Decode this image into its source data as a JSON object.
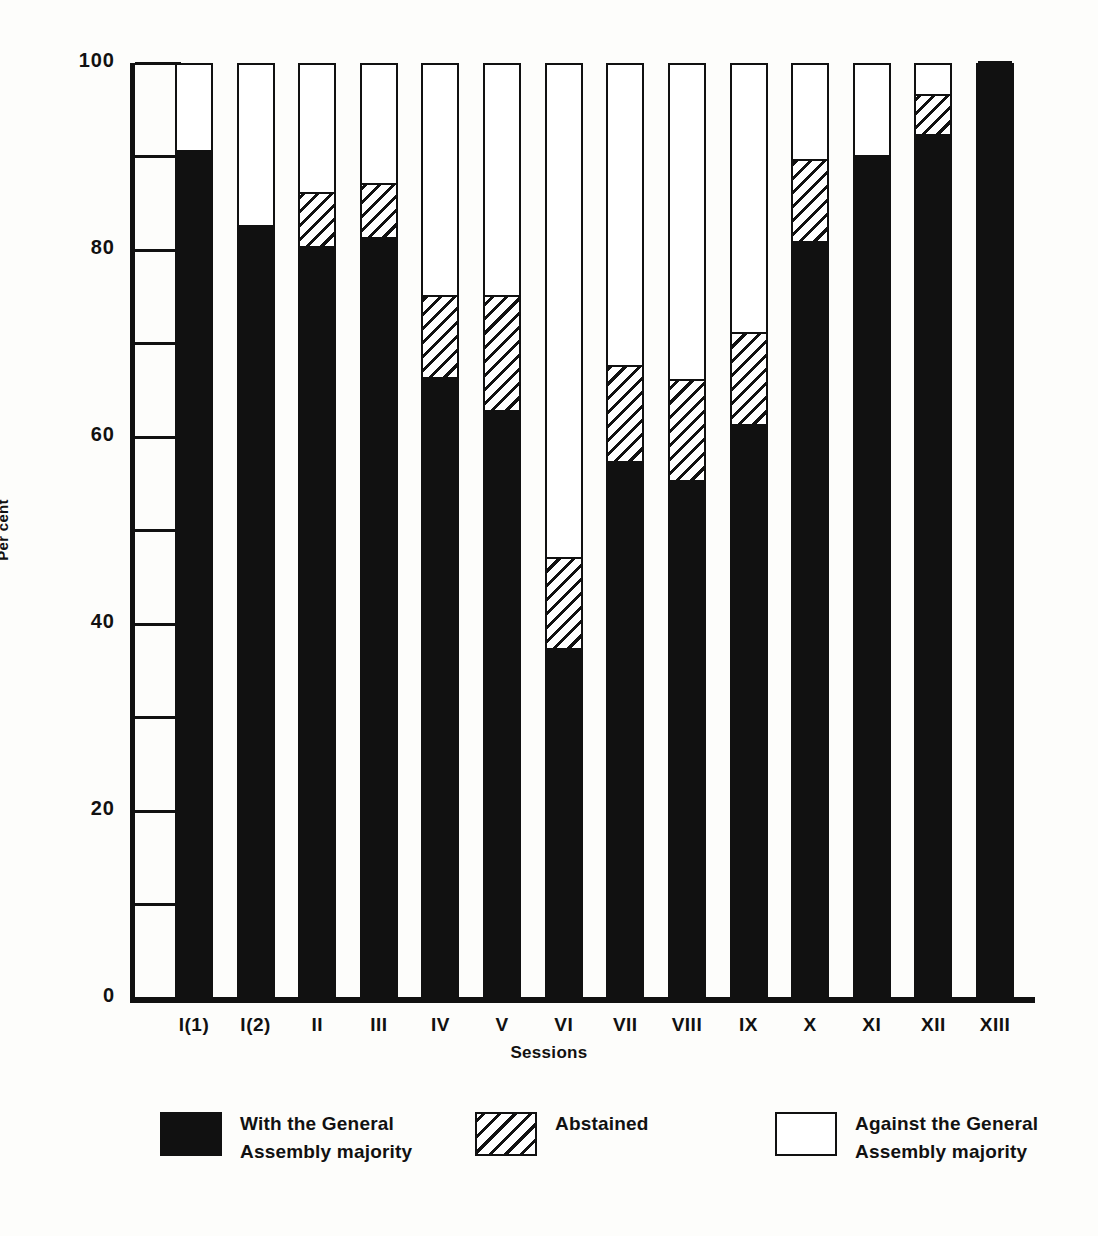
{
  "chart": {
    "type": "bar",
    "ylabel": "Per cent",
    "xlabel": "Sessions"
  },
  "chart_data": {
    "type": "bar",
    "title": "",
    "subtitle": "",
    "xlabel": "Sessions",
    "ylabel": "Per cent",
    "ylim": [
      0,
      100
    ],
    "yticks": [
      0,
      20,
      40,
      60,
      80,
      100
    ],
    "yticks_minor": [
      10,
      30,
      50,
      70,
      90
    ],
    "grid": false,
    "stacked": true,
    "legend_position": "bottom",
    "categories": [
      "I(1)",
      "I(2)",
      "II",
      "III",
      "IV",
      "V",
      "VI",
      "VII",
      "VIII",
      "IX",
      "X",
      "XI",
      "XII",
      "XIII"
    ],
    "series": [
      {
        "name": "With the General Assembly majority",
        "pattern": "solid-black",
        "values": [
          90.5,
          82.5,
          80,
          81,
          66,
          62.5,
          37,
          57,
          55,
          61,
          80.5,
          90,
          92,
          100
        ]
      },
      {
        "name": "Abstained",
        "pattern": "diagonal-hatch",
        "values": [
          0,
          0,
          6,
          6,
          9,
          12.5,
          10,
          10.5,
          11,
          10,
          9,
          0,
          4.5,
          0
        ]
      },
      {
        "name": "Against the General Assembly majority",
        "pattern": "white",
        "values": [
          9.5,
          17.5,
          14,
          13,
          25,
          25,
          53,
          32.5,
          34,
          29,
          10.5,
          10,
          3.5,
          0
        ]
      }
    ],
    "cumulative_tops": {
      "with": [
        90.5,
        82.5,
        80,
        81,
        66,
        62.5,
        37,
        57,
        55,
        61,
        80.5,
        90,
        92,
        100
      ],
      "abstained": [
        90.5,
        82.5,
        86,
        87,
        75,
        75,
        47,
        67.5,
        66,
        71,
        89.5,
        90,
        96.5,
        100
      ]
    }
  },
  "yaxis": {
    "ticks": [
      {
        "value": 100,
        "label": "100",
        "major": true
      },
      {
        "value": 90,
        "label": "",
        "major": false
      },
      {
        "value": 80,
        "label": "80",
        "major": true
      },
      {
        "value": 70,
        "label": "",
        "major": false
      },
      {
        "value": 60,
        "label": "60",
        "major": true
      },
      {
        "value": 50,
        "label": "",
        "major": false
      },
      {
        "value": 40,
        "label": "40",
        "major": true
      },
      {
        "value": 30,
        "label": "",
        "major": false
      },
      {
        "value": 20,
        "label": "20",
        "major": true
      },
      {
        "value": 10,
        "label": "",
        "major": false
      },
      {
        "value": 0,
        "label": "0",
        "major": true
      }
    ]
  },
  "legend": {
    "items": [
      {
        "swatch": "sw-solid",
        "icon_name": "legend-swatch-solid-black",
        "line1": "With the General",
        "line2": "Assembly majority"
      },
      {
        "swatch": "sw-hatch",
        "icon_name": "legend-swatch-hatched",
        "line1": "Abstained",
        "line2": ""
      },
      {
        "swatch": "sw-empty",
        "icon_name": "legend-swatch-white",
        "line1": "Against the General",
        "line2": "Assembly majority"
      }
    ]
  }
}
